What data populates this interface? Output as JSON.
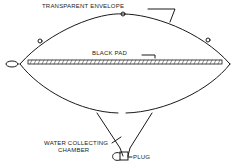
{
  "diagram": {
    "labels": {
      "envelope": "TRANSPARENT ENVELOPE",
      "pad": "BLACK PAD",
      "chamber_line1": "WATER COLLECTING",
      "chamber_line2": "CHAMBER",
      "plug": "PLUG"
    },
    "colors": {
      "ink": "#1a1a1a",
      "background": "#ffffff"
    }
  }
}
